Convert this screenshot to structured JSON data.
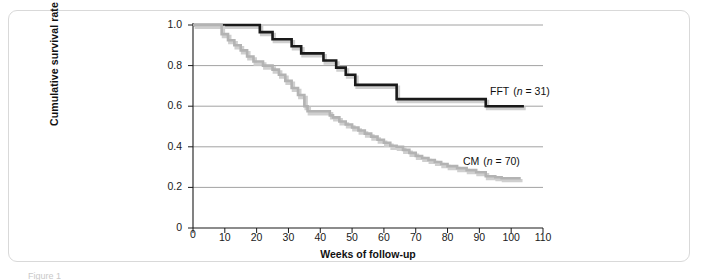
{
  "figure": {
    "caption": "Figure 1"
  },
  "axes": {
    "y_label": "Cumulative survival rate",
    "x_label": "Weeks of follow-up",
    "y_ticks": [
      "1.0",
      "0.8",
      "0.6",
      "0.4",
      "0.2",
      "0"
    ],
    "x_ticks": [
      "0",
      "10",
      "20",
      "30",
      "40",
      "50",
      "60",
      "70",
      "80",
      "90",
      "100",
      "110"
    ]
  },
  "legend": {
    "fft": {
      "name": "FFT",
      "open_paren": "(",
      "n_symbol": "n",
      "equals": " = ",
      "value": "31",
      "close_paren": ")"
    },
    "cm": {
      "name": "CM",
      "open_paren": "(",
      "n_symbol": "n",
      "equals": " = ",
      "value": "70",
      "close_paren": ")"
    }
  },
  "colors": {
    "fft_line": "#1a1a1a",
    "cm_line": "#b3b3b3",
    "shadow": "#cfcfcf",
    "gridline": "#8a8a8a",
    "axis": "#1a1a1a",
    "panel_border": "#d9d9d9",
    "background": "#ffffff"
  },
  "chart_data": {
    "type": "line",
    "title": "",
    "subtitle": "",
    "xlabel": "Weeks of follow-up",
    "ylabel": "Cumulative survival rate",
    "xlim": [
      0,
      110
    ],
    "ylim": [
      0,
      1.0
    ],
    "xticks": [
      0,
      10,
      20,
      30,
      40,
      50,
      60,
      70,
      80,
      90,
      100,
      110
    ],
    "yticks": [
      0,
      0.2,
      0.4,
      0.6,
      0.8,
      1.0
    ],
    "grid": "horizontal",
    "legend_position": "inline-right",
    "step": "post",
    "annotations": [
      {
        "text": "FFT (n = 31)",
        "x": 96,
        "y": 0.655
      },
      {
        "text": "CM (n = 70)",
        "x": 91,
        "y": 0.315
      }
    ],
    "series": [
      {
        "name": "FFT (n = 31)",
        "label": "FFT",
        "n": 31,
        "color": "#1a1a1a",
        "x": [
          0,
          21,
          21,
          25,
          25,
          31,
          31,
          34,
          34,
          41,
          41,
          45,
          45,
          48,
          48,
          51,
          51,
          64,
          64,
          92,
          92,
          104
        ],
        "y": [
          1.0,
          1.0,
          0.965,
          0.965,
          0.93,
          0.93,
          0.895,
          0.895,
          0.86,
          0.86,
          0.825,
          0.825,
          0.79,
          0.79,
          0.755,
          0.755,
          0.705,
          0.705,
          0.635,
          0.635,
          0.6,
          0.6
        ]
      },
      {
        "name": "CM (n = 70)",
        "label": "CM",
        "n": 70,
        "color": "#b3b3b3",
        "x": [
          0,
          9,
          9,
          11,
          11,
          13,
          13,
          15,
          15,
          17,
          17,
          19,
          19,
          22,
          22,
          25,
          25,
          27,
          27,
          29,
          29,
          31,
          31,
          33,
          33,
          35,
          35,
          36,
          36,
          43,
          43,
          44,
          44,
          46,
          46,
          48,
          48,
          50,
          50,
          52,
          52,
          54,
          54,
          56,
          56,
          58,
          58,
          60,
          60,
          62,
          62,
          64,
          64,
          66,
          66,
          68,
          68,
          70,
          70,
          72,
          72,
          74,
          74,
          76,
          76,
          78,
          78,
          80,
          80,
          83,
          83,
          86,
          86,
          89,
          89,
          92,
          92,
          95,
          95,
          97,
          97,
          103
        ],
        "y": [
          1.0,
          1.0,
          0.955,
          0.955,
          0.925,
          0.925,
          0.9,
          0.9,
          0.875,
          0.875,
          0.845,
          0.845,
          0.82,
          0.82,
          0.8,
          0.8,
          0.78,
          0.78,
          0.755,
          0.755,
          0.725,
          0.725,
          0.69,
          0.69,
          0.655,
          0.655,
          0.6,
          0.6,
          0.575,
          0.575,
          0.555,
          0.555,
          0.545,
          0.545,
          0.525,
          0.525,
          0.51,
          0.51,
          0.495,
          0.495,
          0.48,
          0.48,
          0.465,
          0.465,
          0.45,
          0.45,
          0.435,
          0.435,
          0.42,
          0.42,
          0.405,
          0.405,
          0.4,
          0.4,
          0.385,
          0.385,
          0.37,
          0.37,
          0.355,
          0.355,
          0.345,
          0.345,
          0.335,
          0.335,
          0.325,
          0.325,
          0.315,
          0.315,
          0.305,
          0.305,
          0.295,
          0.295,
          0.285,
          0.285,
          0.275,
          0.275,
          0.255,
          0.255,
          0.25,
          0.25,
          0.245,
          0.245
        ]
      }
    ]
  }
}
